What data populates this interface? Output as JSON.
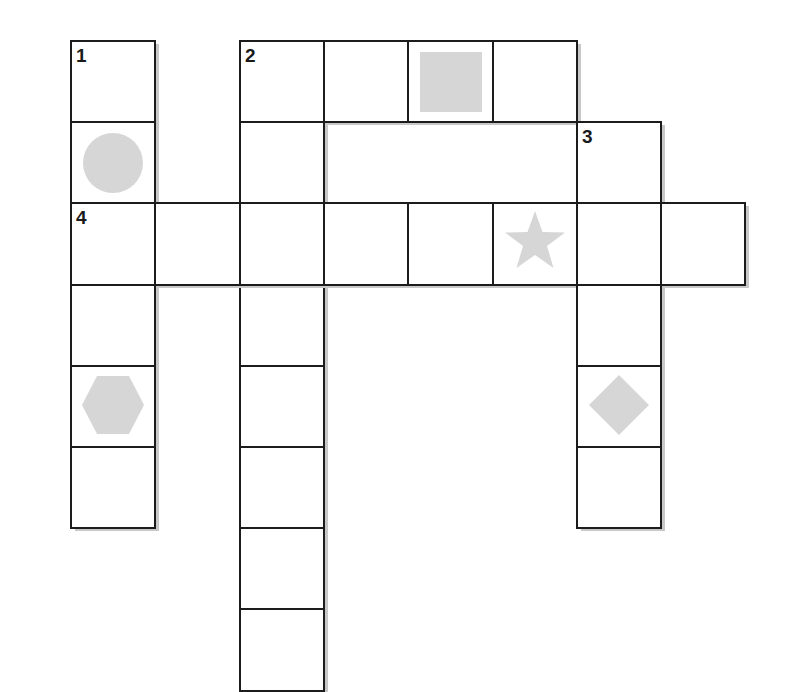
{
  "puzzle": {
    "grid": {
      "origin_x": 71,
      "origin_y": 41,
      "cell_w": 84.3,
      "cell_h": 81.2
    },
    "clue_numbers": [
      "1",
      "2",
      "3",
      "4"
    ],
    "shape_color": "#d6d6d6",
    "line_color": "#1c1c1c",
    "cells": [
      {
        "col": 0,
        "row": 0,
        "number": "1",
        "shape": ""
      },
      {
        "col": 0,
        "row": 1,
        "number": "",
        "shape": "circle"
      },
      {
        "col": 0,
        "row": 2,
        "number": "4",
        "shape": ""
      },
      {
        "col": 0,
        "row": 3,
        "number": "",
        "shape": ""
      },
      {
        "col": 0,
        "row": 4,
        "number": "",
        "shape": "hexagon"
      },
      {
        "col": 0,
        "row": 5,
        "number": "",
        "shape": ""
      },
      {
        "col": 2,
        "row": 0,
        "number": "2",
        "shape": ""
      },
      {
        "col": 3,
        "row": 0,
        "number": "",
        "shape": ""
      },
      {
        "col": 4,
        "row": 0,
        "number": "",
        "shape": "square"
      },
      {
        "col": 5,
        "row": 0,
        "number": "",
        "shape": ""
      },
      {
        "col": 2,
        "row": 1,
        "number": "",
        "shape": ""
      },
      {
        "col": 2,
        "row": 3,
        "number": "",
        "shape": ""
      },
      {
        "col": 2,
        "row": 4,
        "number": "",
        "shape": ""
      },
      {
        "col": 2,
        "row": 5,
        "number": "",
        "shape": ""
      },
      {
        "col": 2,
        "row": 6,
        "number": "",
        "shape": ""
      },
      {
        "col": 2,
        "row": 7,
        "number": "",
        "shape": ""
      },
      {
        "col": 6,
        "row": 1,
        "number": "3",
        "shape": ""
      },
      {
        "col": 1,
        "row": 2,
        "number": "",
        "shape": ""
      },
      {
        "col": 2,
        "row": 2,
        "number": "",
        "shape": ""
      },
      {
        "col": 3,
        "row": 2,
        "number": "",
        "shape": ""
      },
      {
        "col": 4,
        "row": 2,
        "number": "",
        "shape": ""
      },
      {
        "col": 5,
        "row": 2,
        "number": "",
        "shape": "star"
      },
      {
        "col": 6,
        "row": 2,
        "number": "",
        "shape": ""
      },
      {
        "col": 7,
        "row": 2,
        "number": "",
        "shape": ""
      },
      {
        "col": 6,
        "row": 3,
        "number": "",
        "shape": ""
      },
      {
        "col": 6,
        "row": 4,
        "number": "",
        "shape": "diamond"
      },
      {
        "col": 6,
        "row": 5,
        "number": "",
        "shape": ""
      }
    ],
    "words": [
      {
        "number": "1",
        "direction": "down",
        "start": [
          0,
          0
        ],
        "length": 6
      },
      {
        "number": "2",
        "direction": "across",
        "start": [
          2,
          0
        ],
        "length": 4
      },
      {
        "number": "2",
        "direction": "down",
        "start": [
          2,
          0
        ],
        "length": 8
      },
      {
        "number": "3",
        "direction": "down",
        "start": [
          6,
          1
        ],
        "length": 5
      },
      {
        "number": "4",
        "direction": "across",
        "start": [
          0,
          2
        ],
        "length": 8
      }
    ]
  }
}
